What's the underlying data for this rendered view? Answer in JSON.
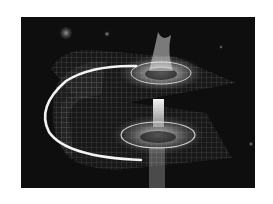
{
  "image": {
    "subject": "wormhole illustration",
    "description": "Folded spacetime grid with two funnel-shaped gravity wells connected by a bright throat",
    "style": "grayscale",
    "frame": {
      "x": 21,
      "y": 17,
      "width": 234,
      "height": 171
    },
    "colors": {
      "page_background": "#ffffff",
      "space": "#0e0e0e",
      "grid": "#bdbdbd",
      "glow": "#ffffff"
    }
  }
}
